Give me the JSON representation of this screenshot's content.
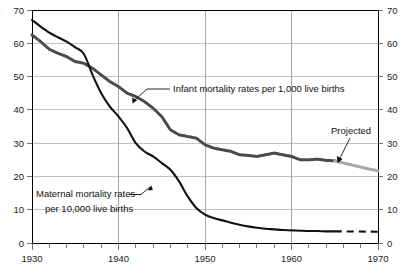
{
  "chart_data": {
    "type": "line",
    "title": "",
    "subtitle": "",
    "xlabel": "",
    "ylabel": "",
    "xlim": [
      1930,
      1970
    ],
    "ylim": [
      0,
      70
    ],
    "grid": true,
    "legend_position": "inline-annotations",
    "x_ticks": [
      "1930",
      "1940",
      "1950",
      "1960",
      "1970"
    ],
    "x_tick_values": [
      1930,
      1940,
      1950,
      1960,
      1970
    ],
    "x_minor_tick_step": 2,
    "y_ticks_left": [
      "0",
      "10",
      "20",
      "30",
      "40",
      "50",
      "60",
      "70"
    ],
    "y_ticks_right": [
      "0",
      "10",
      "20",
      "30",
      "40",
      "50",
      "60",
      "70"
    ],
    "y_tick_values": [
      0,
      10,
      20,
      30,
      40,
      50,
      60,
      70
    ],
    "series": [
      {
        "name": "Infant mortality rates per 1,000 live births",
        "style": "dotted-gray-thick",
        "color": "#4a4a4a",
        "x": [
          1930,
          1931,
          1932,
          1933,
          1934,
          1935,
          1936,
          1937,
          1938,
          1939,
          1940,
          1941,
          1942,
          1943,
          1944,
          1945,
          1946,
          1947,
          1948,
          1949,
          1950,
          1951,
          1952,
          1953,
          1954,
          1955,
          1956,
          1957,
          1958,
          1959,
          1960,
          1961,
          1962,
          1963,
          1964,
          1965
        ],
        "values": [
          62.5,
          60.5,
          58.2,
          57.0,
          56.0,
          54.5,
          54.0,
          52.5,
          50.5,
          48.5,
          47.0,
          45.0,
          44.0,
          42.5,
          40.5,
          38.0,
          34.0,
          32.5,
          32.0,
          31.5,
          29.5,
          28.5,
          28.0,
          27.5,
          26.5,
          26.3,
          26.0,
          26.5,
          27.0,
          26.5,
          26.0,
          25.0,
          25.0,
          25.2,
          24.8,
          24.7
        ],
        "projected": {
          "x": [
            1965,
            1966,
            1967,
            1968,
            1969,
            1970
          ],
          "values": [
            24.7,
            24.0,
            23.4,
            22.8,
            22.2,
            21.7
          ],
          "color": "#a8a8a8",
          "label": "Projected"
        }
      },
      {
        "name": "Maternal mortality rates per 10,000 live births",
        "style": "solid-black",
        "color": "#111111",
        "x": [
          1930,
          1931,
          1932,
          1933,
          1934,
          1935,
          1936,
          1937,
          1938,
          1939,
          1940,
          1941,
          1942,
          1943,
          1944,
          1945,
          1946,
          1947,
          1948,
          1949,
          1950,
          1951,
          1952,
          1953,
          1954,
          1955,
          1956,
          1957,
          1958,
          1959,
          1960,
          1961,
          1962,
          1963,
          1964,
          1965
        ],
        "values": [
          67.0,
          65.0,
          63.2,
          61.8,
          60.5,
          58.8,
          56.8,
          50.5,
          45.0,
          41.0,
          38.0,
          34.5,
          30.0,
          27.5,
          26.0,
          24.0,
          22.0,
          18.5,
          14.0,
          10.5,
          8.5,
          7.5,
          6.8,
          6.1,
          5.5,
          5.0,
          4.6,
          4.3,
          4.1,
          3.9,
          3.8,
          3.7,
          3.6,
          3.6,
          3.5,
          3.5
        ],
        "projected": {
          "x": [
            1965,
            1970
          ],
          "values": [
            3.5,
            3.4
          ],
          "color": "#111111",
          "label": ""
        }
      }
    ],
    "annotations": [
      {
        "id": "infant-annotation",
        "text": "Infant mortality rates per 1,000 live births",
        "points_to": "infant-series"
      },
      {
        "id": "maternal-annotation-line1",
        "text": "Maternal mortality rates",
        "points_to": "maternal-series"
      },
      {
        "id": "maternal-annotation-line2",
        "text": "per 10,000 live births",
        "points_to": "maternal-series"
      },
      {
        "id": "projected-annotation",
        "text": "Projected",
        "points_to": "infant-projected-series"
      }
    ],
    "colors": {
      "background": "#ffffff",
      "axis": "#000000",
      "grid": "#b9b9b9",
      "maternal": "#111111",
      "infant": "#4a4a4a",
      "infant_projected": "#a8a8a8"
    }
  },
  "axes": {
    "y_left": {
      "t70": "70",
      "t60": "60",
      "t50": "50",
      "t40": "40",
      "t30": "30",
      "t20": "20",
      "t10": "10",
      "t0": "0"
    },
    "y_right": {
      "t70": "70",
      "t60": "60",
      "t50": "50",
      "t40": "40",
      "t30": "30",
      "t20": "20",
      "t10": "10",
      "t0": "0"
    },
    "x": {
      "t1930": "1930",
      "t1940": "1940",
      "t1950": "1950",
      "t1960": "1960",
      "t1970": "1970"
    }
  },
  "annotations": {
    "infant": "Infant mortality rates per 1,000 live births",
    "maternal_line1": "Maternal mortality rates",
    "maternal_line2": "per 10,000 live births",
    "projected": "Projected"
  }
}
